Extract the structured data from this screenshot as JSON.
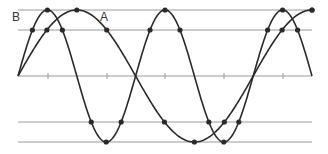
{
  "diagram": {
    "labels": {
      "wave_b": "B",
      "wave_a": "A"
    },
    "colors": {
      "curve": "#2a2a2a",
      "grid": "#9a9a9a",
      "dot": "#2a2a2a",
      "label": "#333333"
    },
    "geometry": {
      "x_start": 18,
      "x_end": 312,
      "midline_y": 76,
      "amplitude": 66,
      "reference_lines_y": [
        10,
        30,
        76,
        122,
        142
      ],
      "midline_ticks_x": [
        48,
        107,
        165,
        224,
        283
      ]
    },
    "waves": [
      {
        "name": "B",
        "period_px": 117.6,
        "phase": 0,
        "cycles": 2.5
      },
      {
        "name": "A",
        "period_px": 235.2,
        "phase": 0,
        "cycles": 1.25
      }
    ]
  }
}
